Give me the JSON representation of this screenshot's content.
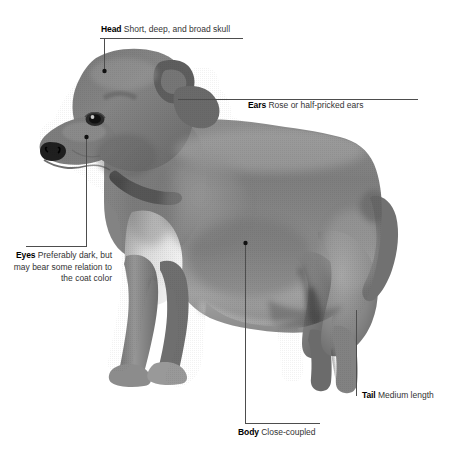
{
  "figure": {
    "background_color": "#ffffff",
    "line_color": "#4d4d4d",
    "text_color": "#1a1a1a"
  },
  "callouts": [
    {
      "id": "head",
      "term": "Head",
      "description": "Short, deep, and broad skull"
    },
    {
      "id": "ears",
      "term": "Ears",
      "description": "Rose or half-pricked ears"
    },
    {
      "id": "eyes",
      "term": "Eyes",
      "description": "Preferably dark, but may bear some relation to the coat color"
    },
    {
      "id": "tail",
      "term": "Tail",
      "description": "Medium length"
    },
    {
      "id": "body",
      "term": "Body",
      "description": "Close-coupled"
    }
  ]
}
